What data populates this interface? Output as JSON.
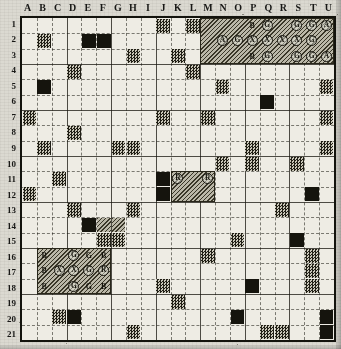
{
  "figure": {
    "type": "grid-map",
    "columns": [
      "A",
      "B",
      "C",
      "D",
      "E",
      "F",
      "G",
      "H",
      "I",
      "J",
      "K",
      "L",
      "M",
      "N",
      "O",
      "P",
      "Q",
      "R",
      "S",
      "T",
      "U"
    ],
    "rows": [
      "1",
      "2",
      "3",
      "4",
      "5",
      "6",
      "7",
      "8",
      "9",
      "10",
      "11",
      "12",
      "13",
      "14",
      "15",
      "16",
      "17",
      "18",
      "19",
      "20",
      "21"
    ],
    "grid_cols": 21,
    "grid_rows": 21,
    "colors": {
      "paper": "#d9d7cf",
      "grid_background": "#eceae2",
      "frame": "#15150f",
      "dark_cell": "#17160f",
      "stipple_cell": "#8d8a7c",
      "hatch_block": "#b9b6a7",
      "gridline": "#1e1c14"
    }
  },
  "chart_data": {
    "type": "heatmap",
    "title": "",
    "xlabel": "",
    "ylabel": "",
    "categories_x": [
      "A",
      "B",
      "C",
      "D",
      "E",
      "F",
      "G",
      "H",
      "I",
      "J",
      "K",
      "L",
      "M",
      "N",
      "O",
      "P",
      "Q",
      "R",
      "S",
      "T",
      "U"
    ],
    "categories_y": [
      "1",
      "2",
      "3",
      "4",
      "5",
      "6",
      "7",
      "8",
      "9",
      "10",
      "11",
      "12",
      "13",
      "14",
      "15",
      "16",
      "17",
      "18",
      "19",
      "20",
      "21"
    ],
    "legend": [],
    "grid": true,
    "cells": [
      {
        "col": "J",
        "row": "1",
        "fill": "stipple"
      },
      {
        "col": "L",
        "row": "1",
        "fill": "stipple"
      },
      {
        "col": "B",
        "row": "2",
        "fill": "stipple"
      },
      {
        "col": "E",
        "row": "2",
        "fill": "dark"
      },
      {
        "col": "F",
        "row": "2",
        "fill": "dark"
      },
      {
        "col": "H",
        "row": "3",
        "fill": "stipple"
      },
      {
        "col": "K",
        "row": "3",
        "fill": "stipple"
      },
      {
        "col": "D",
        "row": "4",
        "fill": "stipple"
      },
      {
        "col": "L",
        "row": "4",
        "fill": "stipple"
      },
      {
        "col": "B",
        "row": "5",
        "fill": "dark"
      },
      {
        "col": "N",
        "row": "5",
        "fill": "stipple"
      },
      {
        "col": "U",
        "row": "5",
        "fill": "stipple"
      },
      {
        "col": "Q",
        "row": "6",
        "fill": "dark"
      },
      {
        "col": "A",
        "row": "7",
        "fill": "stipple"
      },
      {
        "col": "J",
        "row": "7",
        "fill": "stipple"
      },
      {
        "col": "M",
        "row": "7",
        "fill": "stipple"
      },
      {
        "col": "U",
        "row": "7",
        "fill": "stipple"
      },
      {
        "col": "D",
        "row": "8",
        "fill": "stipple"
      },
      {
        "col": "B",
        "row": "9",
        "fill": "stipple"
      },
      {
        "col": "P",
        "row": "9",
        "fill": "stipple"
      },
      {
        "col": "G",
        "row": "9",
        "fill": "stipple"
      },
      {
        "col": "H",
        "row": "9",
        "fill": "stipple"
      },
      {
        "col": "U",
        "row": "9",
        "fill": "stipple"
      },
      {
        "col": "N",
        "row": "10",
        "fill": "stipple"
      },
      {
        "col": "P",
        "row": "10",
        "fill": "stipple"
      },
      {
        "col": "S",
        "row": "10",
        "fill": "stipple"
      },
      {
        "col": "C",
        "row": "11",
        "fill": "stipple"
      },
      {
        "col": "J",
        "row": "11",
        "fill": "dark"
      },
      {
        "col": "A",
        "row": "12",
        "fill": "stipple"
      },
      {
        "col": "J",
        "row": "12",
        "fill": "dark"
      },
      {
        "col": "T",
        "row": "12",
        "fill": "dark"
      },
      {
        "col": "H",
        "row": "13",
        "fill": "stipple"
      },
      {
        "col": "D",
        "row": "13",
        "fill": "stipple"
      },
      {
        "col": "R",
        "row": "13",
        "fill": "stipple"
      },
      {
        "col": "E",
        "row": "14",
        "fill": "dark"
      },
      {
        "col": "F",
        "row": "14",
        "fill": "hatch"
      },
      {
        "col": "G",
        "row": "14",
        "fill": "hatch"
      },
      {
        "col": "F",
        "row": "15",
        "fill": "stipple"
      },
      {
        "col": "G",
        "row": "15",
        "fill": "stipple"
      },
      {
        "col": "O",
        "row": "15",
        "fill": "stipple"
      },
      {
        "col": "S",
        "row": "15",
        "fill": "dark"
      },
      {
        "col": "T",
        "row": "16",
        "fill": "stipple"
      },
      {
        "col": "M",
        "row": "16",
        "fill": "stipple"
      },
      {
        "col": "E",
        "row": "17",
        "fill": "stipple"
      },
      {
        "col": "T",
        "row": "17",
        "fill": "stipple"
      },
      {
        "col": "J",
        "row": "18",
        "fill": "stipple"
      },
      {
        "col": "P",
        "row": "18",
        "fill": "dark"
      },
      {
        "col": "T",
        "row": "18",
        "fill": "stipple"
      },
      {
        "col": "K",
        "row": "19",
        "fill": "stipple"
      },
      {
        "col": "O",
        "row": "20",
        "fill": "dark"
      },
      {
        "col": "C",
        "row": "20",
        "fill": "stipple"
      },
      {
        "col": "D",
        "row": "20",
        "fill": "dark"
      },
      {
        "col": "U",
        "row": "20",
        "fill": "dark"
      },
      {
        "col": "H",
        "row": "21",
        "fill": "stipple"
      },
      {
        "col": "Q",
        "row": "21",
        "fill": "stipple"
      },
      {
        "col": "R",
        "row": "21",
        "fill": "stipple"
      },
      {
        "col": "U",
        "row": "21",
        "fill": "dark"
      }
    ],
    "annotated_blocks": [
      {
        "name": "top-right-block",
        "start_col": "M",
        "end_col": "U",
        "start_row": "1",
        "end_row": "3",
        "fill": "hatch",
        "labels": [
          [
            "",
            "",
            "",
            "B",
            "G",
            "",
            "G",
            "G",
            "A"
          ],
          [
            "",
            "A",
            "G",
            "X",
            "X",
            "X",
            "X",
            "G",
            ""
          ],
          [
            "",
            "",
            "",
            "B",
            "G",
            "",
            "G",
            "G",
            "A"
          ]
        ],
        "circled": [
          [
            false,
            false,
            false,
            false,
            true,
            false,
            true,
            true,
            true
          ],
          [
            false,
            true,
            true,
            true,
            true,
            true,
            true,
            true,
            false
          ],
          [
            false,
            false,
            false,
            false,
            true,
            false,
            true,
            true,
            true
          ]
        ]
      },
      {
        "name": "center-block",
        "start_col": "K",
        "end_col": "M",
        "start_row": "11",
        "end_row": "12",
        "fill": "hatch",
        "labels": [
          [
            "R",
            "",
            "R"
          ],
          [
            "",
            "",
            ""
          ]
        ],
        "circled": [
          [
            true,
            false,
            true
          ],
          [
            false,
            false,
            false
          ]
        ]
      },
      {
        "name": "bottom-left-block",
        "start_col": "B",
        "end_col": "F",
        "start_row": "16",
        "end_row": "18",
        "fill": "hatch",
        "labels": [
          [
            "B",
            "",
            "G",
            "G",
            "B"
          ],
          [
            "B",
            "X",
            "X",
            "G",
            "R"
          ],
          [
            "B",
            "",
            "G",
            "G",
            "B"
          ]
        ],
        "circled": [
          [
            false,
            false,
            true,
            false,
            false
          ],
          [
            false,
            true,
            true,
            true,
            true
          ],
          [
            false,
            false,
            true,
            false,
            false
          ]
        ]
      }
    ]
  }
}
